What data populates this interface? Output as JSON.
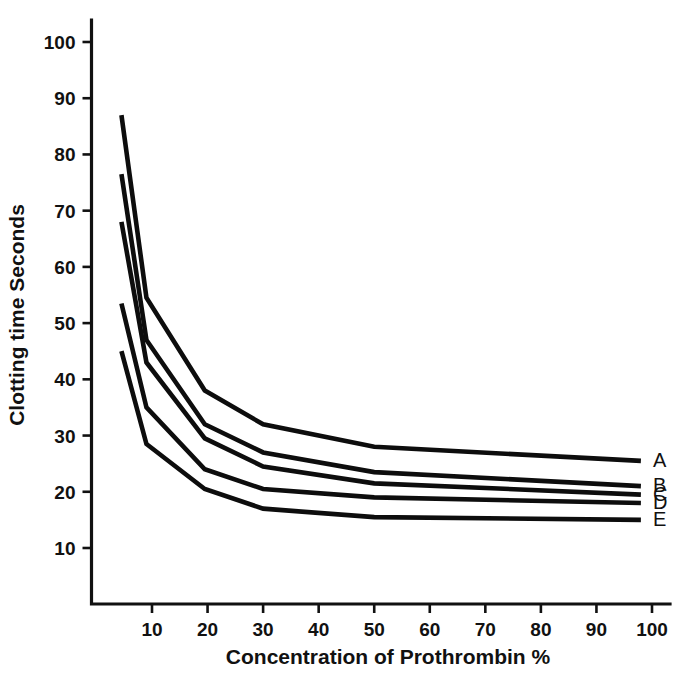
{
  "chart_data": {
    "type": "line",
    "title": "",
    "xlabel": "Concentration of Prothrombin %",
    "ylabel": "Clotting time Seconds",
    "xlim": [
      0,
      104
    ],
    "ylim": [
      5,
      105
    ],
    "xticks": [
      10,
      20,
      30,
      40,
      50,
      60,
      70,
      80,
      90,
      100
    ],
    "xtick_labels": [
      "10",
      "20",
      "30",
      "40",
      "50",
      "60",
      "70",
      "80",
      "90",
      "100"
    ],
    "yticks": [
      10,
      20,
      30,
      40,
      50,
      60,
      70,
      80,
      90,
      100
    ],
    "ytick_labels": [
      "10",
      "20",
      "30",
      "40",
      "50",
      "60",
      "70",
      "80",
      "90",
      "100"
    ],
    "grid": false,
    "legend_position": "right-inline",
    "line_color": "#0d0d0d",
    "x": [
      4.5,
      9,
      19.5,
      30,
      50,
      98
    ],
    "series": [
      {
        "name": "A",
        "label": "A",
        "values": [
          87.0,
          54.5,
          38.0,
          32.0,
          28.0,
          25.5
        ]
      },
      {
        "name": "B",
        "label": "B",
        "values": [
          76.5,
          47.0,
          32.0,
          27.0,
          23.5,
          21.0
        ]
      },
      {
        "name": "C",
        "label": "C",
        "values": [
          68.0,
          43.0,
          29.5,
          24.5,
          21.5,
          19.5
        ]
      },
      {
        "name": "D",
        "label": "D",
        "values": [
          53.5,
          35.0,
          24.0,
          20.5,
          19.0,
          18.0
        ]
      },
      {
        "name": "E",
        "label": "E",
        "values": [
          45.0,
          28.5,
          20.5,
          17.0,
          15.5,
          15.0
        ]
      }
    ]
  }
}
